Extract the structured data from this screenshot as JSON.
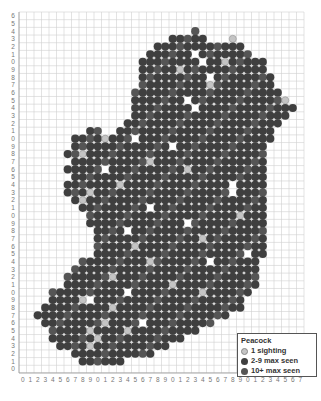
{
  "map": {
    "title": "Peacock distribution grid",
    "grid": {
      "cols": 38,
      "rows": 47,
      "origin_x": 19,
      "origin_y": 12,
      "cell_w": 7.5,
      "cell_h": 7.68
    },
    "x_labels": [
      "0",
      "1",
      "2",
      "3",
      "4",
      "5",
      "6",
      "7",
      "8",
      "9",
      "0",
      "1",
      "2",
      "3",
      "4",
      "5",
      "6",
      "7",
      "8",
      "9",
      "0",
      "1",
      "2",
      "3",
      "4",
      "5",
      "6",
      "7",
      "8",
      "9",
      "0",
      "1",
      "2",
      "3",
      "4",
      "5",
      "6",
      "7"
    ],
    "y_labels_top_to_bottom": [
      "6",
      "5",
      "4",
      "3",
      "2",
      "1",
      "0",
      "9",
      "8",
      "7",
      "6",
      "5",
      "4",
      "3",
      "2",
      "1",
      "0",
      "9",
      "8",
      "7",
      "6",
      "5",
      "4",
      "3",
      "2",
      "1",
      "0",
      "9",
      "8",
      "7",
      "6",
      "5",
      "4",
      "3",
      "2",
      "1",
      "0",
      "9",
      "8",
      "7",
      "6",
      "5",
      "4",
      "3",
      "2",
      "1",
      "0"
    ],
    "colors": {
      "single": "#c4c4c4",
      "few": "#3f3f3f",
      "many": "#555555",
      "grid": "#d0d0d0",
      "label": "#777777"
    },
    "row_spans": [
      [
        [
          23,
          24
        ]
      ],
      [
        [
          20,
          25
        ],
        [
          28,
          29
        ]
      ],
      [
        [
          18,
          30
        ]
      ],
      [
        [
          17,
          31
        ]
      ],
      [
        [
          16,
          33
        ]
      ],
      [
        [
          16,
          33
        ]
      ],
      [
        [
          16,
          34
        ]
      ],
      [
        [
          16,
          34
        ]
      ],
      [
        [
          15,
          35
        ]
      ],
      [
        [
          15,
          36
        ]
      ],
      [
        [
          15,
          37
        ]
      ],
      [
        [
          15,
          36
        ]
      ],
      [
        [
          14,
          35
        ]
      ],
      [
        [
          9,
          11
        ],
        [
          13,
          34
        ]
      ],
      [
        [
          7,
          34
        ]
      ],
      [
        [
          7,
          33
        ]
      ],
      [
        [
          6,
          33
        ]
      ],
      [
        [
          7,
          33
        ]
      ],
      [
        [
          6,
          33
        ]
      ],
      [
        [
          7,
          33
        ]
      ],
      [
        [
          6,
          33
        ]
      ],
      [
        [
          6,
          33
        ]
      ],
      [
        [
          7,
          33
        ]
      ],
      [
        [
          8,
          33
        ]
      ],
      [
        [
          9,
          33
        ]
      ],
      [
        [
          9,
          33
        ]
      ],
      [
        [
          10,
          33
        ]
      ],
      [
        [
          10,
          33
        ]
      ],
      [
        [
          10,
          33
        ]
      ],
      [
        [
          10,
          33
        ]
      ],
      [
        [
          8,
          32
        ]
      ],
      [
        [
          7,
          32
        ]
      ],
      [
        [
          6,
          32
        ]
      ],
      [
        [
          6,
          32
        ]
      ],
      [
        [
          4,
          31
        ]
      ],
      [
        [
          4,
          30
        ]
      ],
      [
        [
          3,
          30
        ]
      ],
      [
        [
          2,
          28
        ]
      ],
      [
        [
          3,
          26
        ]
      ],
      [
        [
          4,
          24
        ]
      ],
      [
        [
          4,
          22
        ]
      ],
      [
        [
          5,
          20
        ]
      ],
      [
        [
          7,
          18
        ]
      ],
      [
        [
          8,
          14
        ]
      ]
    ],
    "single_cells": [
      [
        2,
        22
      ],
      [
        3,
        28
      ],
      [
        6,
        27
      ],
      [
        7,
        21
      ],
      [
        9,
        25
      ],
      [
        11,
        35
      ],
      [
        13,
        10
      ],
      [
        14,
        8
      ],
      [
        15,
        5
      ],
      [
        16,
        11
      ],
      [
        18,
        8
      ],
      [
        19,
        17
      ],
      [
        20,
        22
      ],
      [
        22,
        13
      ],
      [
        23,
        9
      ],
      [
        24,
        8
      ],
      [
        25,
        4
      ],
      [
        26,
        29
      ],
      [
        29,
        24
      ],
      [
        30,
        15
      ],
      [
        31,
        7
      ],
      [
        32,
        17
      ],
      [
        34,
        12
      ],
      [
        35,
        20
      ],
      [
        36,
        24
      ],
      [
        37,
        8
      ],
      [
        38,
        12
      ],
      [
        40,
        11
      ],
      [
        41,
        9
      ],
      [
        41,
        14
      ],
      [
        42,
        10
      ],
      [
        43,
        9
      ]
    ],
    "empty_cells": [
      [
        5,
        23
      ],
      [
        6,
        24
      ],
      [
        8,
        25
      ],
      [
        11,
        22
      ],
      [
        12,
        23
      ],
      [
        16,
        15
      ],
      [
        17,
        20
      ],
      [
        20,
        11
      ],
      [
        22,
        28
      ],
      [
        23,
        28
      ],
      [
        25,
        17
      ],
      [
        27,
        22
      ],
      [
        28,
        14
      ],
      [
        31,
        30
      ],
      [
        32,
        25
      ],
      [
        36,
        14
      ],
      [
        37,
        9
      ],
      [
        40,
        16
      ]
    ]
  },
  "legend": {
    "title": "Peacock",
    "items": [
      {
        "label": "1 sighting",
        "color": "#c4c4c4"
      },
      {
        "label": "2-9 max seen",
        "color": "#3f3f3f"
      },
      {
        "label": "10+ max seen",
        "color": "#555555"
      }
    ]
  }
}
